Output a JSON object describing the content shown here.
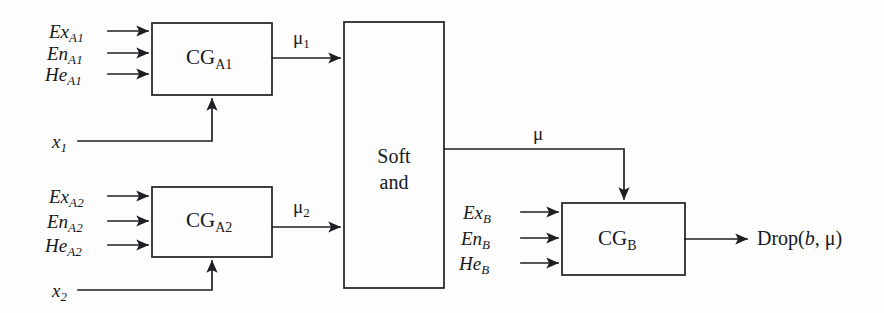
{
  "figure": {
    "type": "block-diagram",
    "background_color": "#fdfdfd",
    "line_color": "#1d1f22",
    "text_color": "#17181a"
  },
  "blocks": {
    "cg_a1": {
      "label_main": "CG",
      "label_sub": "A1",
      "x": 152,
      "y": 23,
      "w": 120,
      "h": 72
    },
    "cg_a2": {
      "label_main": "CG",
      "label_sub": "A2",
      "x": 152,
      "y": 187,
      "w": 120,
      "h": 70
    },
    "soft_and": {
      "line1": "Soft",
      "line2": "and",
      "x": 344,
      "y": 22,
      "w": 100,
      "h": 266
    },
    "cg_b": {
      "label_main": "CG",
      "label_sub": "B",
      "x": 562,
      "y": 203,
      "w": 123,
      "h": 72
    }
  },
  "inputs_a1": [
    {
      "main": "Ex",
      "sub": "A1"
    },
    {
      "main": "En",
      "sub": "A1"
    },
    {
      "main": "He",
      "sub": "A1"
    }
  ],
  "inputs_a2": [
    {
      "main": "Ex",
      "sub": "A2"
    },
    {
      "main": "En",
      "sub": "A2"
    },
    {
      "main": "He",
      "sub": "A2"
    }
  ],
  "inputs_b": [
    {
      "main": "Ex",
      "sub": "B"
    },
    {
      "main": "En",
      "sub": "B"
    },
    {
      "main": "He",
      "sub": "B"
    }
  ],
  "bottom_inputs": [
    {
      "main": "x",
      "sub": "1"
    },
    {
      "main": "x",
      "sub": "2"
    }
  ],
  "signals": {
    "mu1": {
      "main": "μ",
      "sub": "1"
    },
    "mu2": {
      "main": "μ",
      "sub": "2"
    },
    "mu": {
      "main": "μ",
      "sub": ""
    }
  },
  "output": {
    "prefix": "Drop(",
    "italic_var": "b",
    "separator": ", ",
    "greek": "μ",
    "suffix": ")"
  }
}
